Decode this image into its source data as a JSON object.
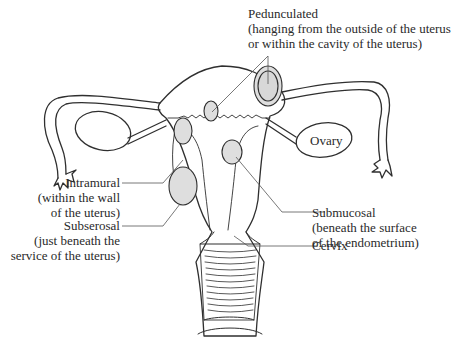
{
  "diagram": {
    "colors": {
      "line": "#2f2f2f",
      "fibroid_fill": "#dedede",
      "leader": "#555555",
      "background": "#ffffff"
    },
    "labels": {
      "pedunculated": {
        "title": "Pedunculated",
        "desc1": "(hanging from the outside of the uterus",
        "desc2": "or within the cavity of the uterus)"
      },
      "ovary": {
        "title": "Ovary"
      },
      "intramural": {
        "title": "Intramural",
        "desc1": "(within the wall",
        "desc2": "of the uterus)"
      },
      "submucosal": {
        "title": "Submucosal",
        "desc1": "(beneath the surface",
        "desc2": "of the endometrium)"
      },
      "subserosal": {
        "title": "Subserosal",
        "desc1": "(just beneath the",
        "desc2": "service of the uterus)"
      },
      "cervix": {
        "title": "Cervix"
      }
    }
  }
}
